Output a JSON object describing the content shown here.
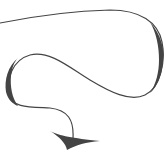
{
  "image": {
    "kind": "decorative-curly-arrow",
    "width": 166,
    "height": 160,
    "background": "#ffffff",
    "stroke_color": "#444444"
  }
}
